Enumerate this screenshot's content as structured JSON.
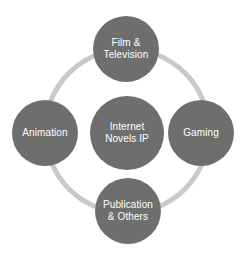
{
  "diagram": {
    "type": "hub-and-spoke",
    "background_color": "#ffffff",
    "node_fill_color": "#6e6e6e",
    "node_text_color": "#ffffff",
    "ring_color": "#c9c9c9",
    "hub": {
      "id": "internet-novels-ip",
      "label": "Internet\nNovels IP",
      "role": "center"
    },
    "satellites": [
      {
        "id": "film-television",
        "label": "Film &\nTelevision",
        "position": "top"
      },
      {
        "id": "gaming",
        "label": "Gaming",
        "position": "right"
      },
      {
        "id": "publication-others",
        "label": "Publication\n& Others",
        "position": "bottom"
      },
      {
        "id": "animation",
        "label": "Animation",
        "position": "left"
      }
    ]
  }
}
